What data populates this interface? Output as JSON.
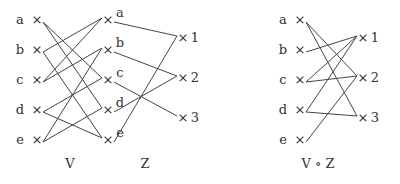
{
  "diagrams": [
    {
      "caption": "V",
      "left": [
        "a",
        "b",
        "c",
        "d",
        "e"
      ],
      "right": [
        "a",
        "b",
        "c",
        "d",
        "e"
      ],
      "edges": [
        [
          "a",
          "c"
        ],
        [
          "a",
          "d"
        ],
        [
          "b",
          "a"
        ],
        [
          "b",
          "e"
        ],
        [
          "c",
          "a"
        ],
        [
          "c",
          "b"
        ],
        [
          "d",
          "c"
        ],
        [
          "d",
          "e"
        ],
        [
          "e",
          "b"
        ],
        [
          "e",
          "d"
        ]
      ]
    },
    {
      "caption": "Z",
      "left": [
        "a",
        "b",
        "c",
        "d",
        "e"
      ],
      "right": [
        "1",
        "2",
        "3"
      ],
      "edges": [
        [
          "a",
          "1"
        ],
        [
          "b",
          "2"
        ],
        [
          "c",
          "3"
        ],
        [
          "d",
          "2"
        ],
        [
          "e",
          "1"
        ]
      ]
    },
    {
      "caption": "V ∘ Z",
      "left": [
        "a",
        "b",
        "c",
        "d",
        "e"
      ],
      "right": [
        "1",
        "2",
        "3"
      ],
      "edges": [
        [
          "a",
          "2"
        ],
        [
          "a",
          "3"
        ],
        [
          "b",
          "1"
        ],
        [
          "c",
          "1"
        ],
        [
          "c",
          "2"
        ],
        [
          "d",
          "1"
        ],
        [
          "d",
          "3"
        ],
        [
          "e",
          "2"
        ]
      ]
    }
  ],
  "marker": "×"
}
